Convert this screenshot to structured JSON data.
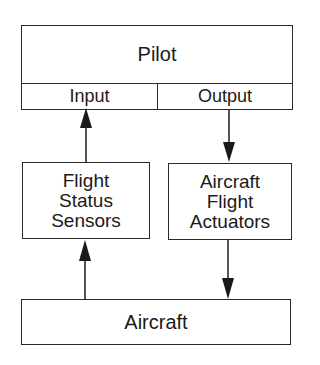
{
  "diagram": {
    "pilot": {
      "title": "Pilot",
      "input_label": "Input",
      "output_label": "Output"
    },
    "sensors": {
      "lines": [
        "Flight",
        "Status",
        "Sensors"
      ]
    },
    "actuators": {
      "lines": [
        "Aircraft",
        "Flight",
        "Actuators"
      ]
    },
    "aircraft": {
      "title": "Aircraft"
    },
    "edges": [
      {
        "from": "Flight Status Sensors",
        "to": "Pilot Input",
        "direction": "up"
      },
      {
        "from": "Pilot Output",
        "to": "Aircraft Flight Actuators",
        "direction": "down"
      },
      {
        "from": "Aircraft",
        "to": "Flight Status Sensors",
        "direction": "up"
      },
      {
        "from": "Aircraft Flight Actuators",
        "to": "Aircraft",
        "direction": "down"
      }
    ],
    "colors": {
      "stroke": "#2a2a2a",
      "background": "#ffffff",
      "text": "#1a1a1a"
    }
  }
}
